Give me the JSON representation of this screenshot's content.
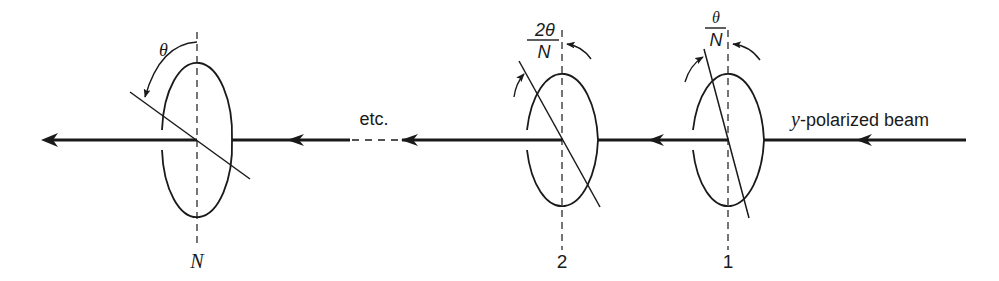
{
  "figure": {
    "colors": {
      "ink": "#1a1a1a",
      "background": "#ffffff"
    },
    "beam_label_prefix": "y",
    "beam_label_suffix": "-polarized beam",
    "etc_label": "etc.",
    "polarizers": [
      {
        "id": "1",
        "label": "1",
        "angle_label_num": "θ",
        "angle_label_den": "N"
      },
      {
        "id": "2",
        "label": "2",
        "angle_label_num": "2θ",
        "angle_label_den": "N"
      },
      {
        "id": "N",
        "label": "N",
        "angle_label": "θ"
      }
    ]
  }
}
